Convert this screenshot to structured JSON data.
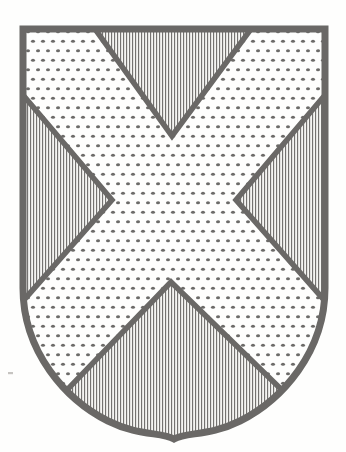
{
  "figure": {
    "kind": "heraldic-shield",
    "shape_name": "ogival escutcheon",
    "background_color": "#ffffff",
    "ink_color": "#1c1a18",
    "outline_width_px": 7
  },
  "blazon": {
    "field_tincture": "Or",
    "field_hatching": "dots",
    "charge_name": "saltire",
    "charge_tincture": "Or",
    "charge_hatching": "dots",
    "compartment_tincture": "Gules",
    "compartment_hatching": "vertical-lines",
    "description": "Gules, a saltire Or"
  },
  "hatching": {
    "dot_spacing_x_px": 10,
    "dot_spacing_y_px": 9.5,
    "dot_radius_px": 1.7,
    "dot_color": "#201e1c",
    "line_spacing_px": 3,
    "line_width_px": 1.15,
    "line_color": "#2b2927"
  },
  "geometry": {
    "canvas_width": 346,
    "canvas_height": 452,
    "shield_left_x": 23,
    "shield_right_x": 325,
    "shield_top_y": 29,
    "shield_shoulder_y": 288,
    "shield_point_x": 174,
    "shield_point_y": 439,
    "shield_outline_path": "M 23 29 L 325 29 L 325 288 C 325 352 282 400 240 421 C 210 436 186 432 174 439 C 162 432 138 436 108 421 C 66 400 23 352 23 288 Z",
    "saltire_top_left_x": 95,
    "saltire_top_right_x": 251,
    "saltire_side_top_y": 95,
    "saltire_side_bottom_y": 301,
    "chief_apex_x": 172,
    "chief_apex_y": 136,
    "base_apex_x": 171,
    "base_apex_y": 282,
    "dexter_apex_x": 112,
    "dexter_apex_y": 200,
    "sinister_apex_x": 236,
    "sinister_apex_y": 200
  },
  "compartments": [
    {
      "id": "chief",
      "label": "chief triangle",
      "position": "top",
      "tincture": "Gules",
      "hatching": "vertical-lines",
      "path": "M 95 29 L 251 29 L 172 136 Z"
    },
    {
      "id": "dexter-flank",
      "label": "dexter flank triangle",
      "position": "left",
      "tincture": "Gules",
      "hatching": "vertical-lines",
      "path": "M 23 95 L 112 200 L 23 301 Z"
    },
    {
      "id": "sinister-flank",
      "label": "sinister flank triangle",
      "position": "right",
      "tincture": "Gules",
      "hatching": "vertical-lines",
      "path": "M 325 95 L 236 200 L 325 301 Z"
    },
    {
      "id": "base",
      "label": "base triangle",
      "position": "bottom",
      "tincture": "Gules",
      "hatching": "vertical-lines",
      "path": "M 171 282 L 287 395 C 255 424 200 437 174 439 C 148 437 94 424 62 395 Z"
    }
  ]
}
